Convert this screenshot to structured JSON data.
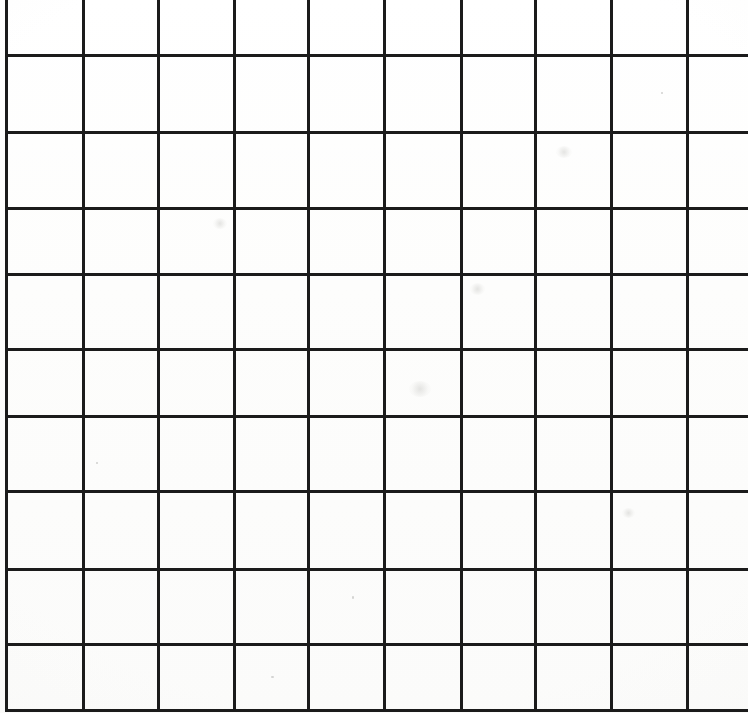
{
  "document": {
    "kind": "scanned-grid-paper",
    "title": "Blank square grid paper scan",
    "width": 748,
    "height": 713,
    "background_color": "#ffffff",
    "line_color": "#1b1b1b",
    "line_thickness": 3,
    "visible_text": "",
    "notes": "No text, labels, numbers or icons are present in the image."
  },
  "grid": {
    "cell_width": 76,
    "cell_height": 75,
    "vertical_line_count": 10,
    "horizontal_line_count": 10,
    "vertical_lines_x": [
      5,
      82,
      157,
      233,
      307,
      383,
      460,
      534,
      610,
      686
    ],
    "horizontal_lines_y": [
      54,
      131,
      207,
      273,
      348,
      415,
      490,
      568,
      643,
      709
    ],
    "cropped_edges": [
      "top",
      "right"
    ],
    "left_border_x": 5,
    "bottom_border_y": 709
  },
  "artifacts": {
    "smudges": [
      {
        "x": 556,
        "y": 146,
        "w": 16,
        "h": 12
      },
      {
        "x": 213,
        "y": 218,
        "w": 14,
        "h": 11
      },
      {
        "x": 470,
        "y": 283,
        "w": 15,
        "h": 12
      },
      {
        "x": 409,
        "y": 381,
        "w": 22,
        "h": 16
      },
      {
        "x": 622,
        "y": 508,
        "w": 13,
        "h": 10
      }
    ],
    "specks": [
      {
        "x": 96,
        "y": 462,
        "w": 2,
        "h": 2
      },
      {
        "x": 352,
        "y": 596,
        "w": 2,
        "h": 3
      },
      {
        "x": 661,
        "y": 92,
        "w": 2,
        "h": 2
      },
      {
        "x": 271,
        "y": 676,
        "w": 3,
        "h": 2
      }
    ]
  }
}
